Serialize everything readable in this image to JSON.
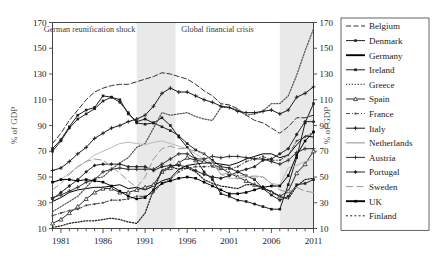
{
  "chart_data": {
    "type": "line",
    "title": "",
    "xlabel": "",
    "ylabel": "% of GDP",
    "ylabel_right": "% of GDP",
    "xlim": [
      1980,
      2011
    ],
    "ylim": [
      10,
      170
    ],
    "yticks": [
      10,
      30,
      50,
      70,
      90,
      110,
      130,
      150,
      170
    ],
    "xticks": [
      1981,
      1986,
      1991,
      1996,
      2001,
      2006,
      2011
    ],
    "x_minor_step": 1,
    "grid": false,
    "legend_position": "right-outside",
    "annotations": [
      {
        "text": "German reunification shock",
        "x": 1984.4,
        "y": 163
      },
      {
        "text": "Global financial crisis",
        "x": 1999.6,
        "y": 163
      }
    ],
    "shaded_bands": [
      {
        "label": "German reunification shock",
        "x0": 1990.0,
        "x1": 1994.6,
        "color": "#e9e9e9"
      },
      {
        "label": "Global financial crisis",
        "x0": 2007.0,
        "x1": 2011.0,
        "color": "#e9e9e9"
      }
    ],
    "x": [
      1980,
      1981,
      1982,
      1983,
      1984,
      1985,
      1986,
      1987,
      1988,
      1989,
      1990,
      1991,
      1992,
      1993,
      1994,
      1995,
      1996,
      1997,
      1998,
      1999,
      2000,
      2001,
      2002,
      2003,
      2004,
      2005,
      2006,
      2007,
      2008,
      2009,
      2010,
      2011
    ],
    "series": [
      {
        "name": "Belgium",
        "style": "dashed",
        "marker": "none",
        "color": "#333333",
        "values": [
          76,
          84,
          94,
          102,
          110,
          116,
          119,
          121,
          122,
          122,
          124,
          126,
          128,
          131,
          130,
          128,
          126,
          122,
          117,
          113,
          107,
          106,
          103,
          98,
          94,
          92,
          88,
          84,
          89,
          96,
          96,
          98
        ]
      },
      {
        "name": "Denmark",
        "style": "solid",
        "marker": "square",
        "color": "#222222",
        "values": [
          70,
          78,
          88,
          95,
          99,
          103,
          109,
          112,
          108,
          100,
          92,
          91,
          92,
          89,
          86,
          82,
          76,
          71,
          68,
          63,
          58,
          57,
          54,
          51,
          48,
          41,
          36,
          32,
          35,
          44,
          45,
          48
        ]
      },
      {
        "name": "Germany",
        "style": "solid",
        "marker": "none",
        "color": "#000000",
        "values": [
          31,
          34,
          38,
          40,
          41,
          42,
          42,
          43,
          44,
          41,
          42,
          40,
          43,
          47,
          49,
          56,
          59,
          60,
          61,
          61,
          60,
          59,
          61,
          64,
          66,
          68,
          68,
          65,
          67,
          75,
          82,
          81
        ]
      },
      {
        "name": "Ireland",
        "style": "solid",
        "marker": "square",
        "color": "#1c1c1c",
        "values": [
          72,
          79,
          89,
          98,
          102,
          104,
          113,
          112,
          110,
          99,
          93,
          95,
          92,
          96,
          90,
          81,
          73,
          64,
          54,
          48,
          37,
          35,
          32,
          31,
          29,
          27,
          25,
          25,
          44,
          65,
          92,
          107
        ]
      },
      {
        "name": "Greece",
        "style": "dotted",
        "marker": "none",
        "color": "#555555",
        "values": [
          23,
          27,
          31,
          35,
          42,
          49,
          50,
          56,
          61,
          65,
          73,
          76,
          88,
          100,
          98,
          99,
          100,
          97,
          95,
          94,
          104,
          104,
          102,
          98,
          99,
          101,
          107,
          107,
          113,
          129,
          148,
          165
        ]
      },
      {
        "name": "Spain",
        "style": "solid",
        "marker": "triangle-open",
        "color": "#2a2a2a",
        "values": [
          14,
          17,
          22,
          27,
          33,
          38,
          41,
          41,
          38,
          38,
          40,
          42,
          44,
          54,
          57,
          61,
          65,
          63,
          62,
          60,
          57,
          53,
          50,
          47,
          44,
          42,
          38,
          35,
          39,
          53,
          60,
          70
        ]
      },
      {
        "name": "France",
        "style": "dash-dot",
        "marker": "dot",
        "color": "#4a4a4a",
        "values": [
          20,
          22,
          24,
          25,
          28,
          29,
          30,
          32,
          32,
          33,
          35,
          35,
          38,
          45,
          48,
          54,
          57,
          58,
          58,
          58,
          56,
          56,
          58,
          62,
          64,
          66,
          63,
          63,
          67,
          78,
          81,
          85
        ]
      },
      {
        "name": "Italy",
        "style": "solid",
        "marker": "plus",
        "color": "#1a1a1a",
        "values": [
          55,
          57,
          62,
          68,
          73,
          80,
          84,
          88,
          90,
          93,
          95,
          98,
          105,
          115,
          119,
          116,
          116,
          113,
          110,
          108,
          105,
          104,
          101,
          100,
          100,
          101,
          102,
          99,
          102,
          112,
          115,
          120
        ]
      },
      {
        "name": "Netherlands",
        "style": "solid",
        "marker": "none",
        "color": "#b9b9b9",
        "values": [
          45,
          48,
          53,
          58,
          62,
          67,
          70,
          73,
          76,
          77,
          76,
          75,
          77,
          78,
          76,
          74,
          72,
          68,
          64,
          61,
          52,
          49,
          49,
          50,
          51,
          50,
          45,
          44,
          57,
          59,
          62,
          64
        ]
      },
      {
        "name": "Austria",
        "style": "solid",
        "marker": "plus",
        "color": "#2f2f2f",
        "values": [
          34,
          36,
          39,
          42,
          46,
          48,
          54,
          56,
          57,
          56,
          56,
          56,
          56,
          60,
          64,
          68,
          68,
          64,
          64,
          66,
          65,
          66,
          66,
          65,
          64,
          64,
          62,
          60,
          63,
          69,
          72,
          72
        ]
      },
      {
        "name": "Portugal",
        "style": "solid",
        "marker": "diamond",
        "color": "#262626",
        "values": [
          33,
          38,
          43,
          48,
          54,
          59,
          60,
          60,
          60,
          58,
          58,
          58,
          55,
          58,
          59,
          59,
          58,
          55,
          52,
          50,
          49,
          51,
          54,
          56,
          58,
          63,
          64,
          68,
          72,
          83,
          93,
          93
        ]
      },
      {
        "name": "Sweden",
        "style": "long-dash",
        "marker": "none",
        "color": "#9a9a9a",
        "values": [
          40,
          45,
          52,
          58,
          62,
          64,
          63,
          58,
          53,
          47,
          42,
          50,
          64,
          72,
          74,
          72,
          72,
          70,
          68,
          62,
          52,
          53,
          51,
          51,
          50,
          50,
          45,
          40,
          38,
          42,
          39,
          38
        ]
      },
      {
        "name": "UK",
        "style": "solid",
        "marker": "square-filled",
        "color": "#000000",
        "values": [
          46,
          48,
          48,
          47,
          48,
          47,
          46,
          43,
          39,
          35,
          33,
          34,
          40,
          45,
          47,
          49,
          50,
          49,
          46,
          43,
          40,
          37,
          37,
          38,
          40,
          42,
          43,
          43,
          51,
          67,
          78,
          85
        ]
      },
      {
        "name": "Finland",
        "style": "dotted",
        "marker": "none",
        "color": "#1f1f1f",
        "values": [
          11,
          12,
          14,
          15,
          16,
          16,
          17,
          18,
          17,
          15,
          14,
          22,
          40,
          55,
          58,
          56,
          57,
          54,
          48,
          45,
          43,
          42,
          41,
          44,
          44,
          41,
          39,
          35,
          33,
          43,
          48,
          49
        ]
      }
    ],
    "legend_entries": [
      {
        "label": "Belgium",
        "style": "dashed",
        "marker": "none"
      },
      {
        "label": "Denmark",
        "style": "solid",
        "marker": "square"
      },
      {
        "label": "Germany",
        "style": "solid-thick",
        "marker": "none"
      },
      {
        "label": "Ireland",
        "style": "solid",
        "marker": "square"
      },
      {
        "label": "Greece",
        "style": "dotted",
        "marker": "none"
      },
      {
        "label": "Spain",
        "style": "solid",
        "marker": "triangle-open"
      },
      {
        "label": "France",
        "style": "dash-dot",
        "marker": "dot"
      },
      {
        "label": "Italy",
        "style": "solid",
        "marker": "plus"
      },
      {
        "label": "Netherlands",
        "style": "solid-light",
        "marker": "none"
      },
      {
        "label": "Austria",
        "style": "solid",
        "marker": "plus"
      },
      {
        "label": "Portugal",
        "style": "solid",
        "marker": "diamond"
      },
      {
        "label": "Sweden",
        "style": "long-dash",
        "marker": "none"
      },
      {
        "label": "UK",
        "style": "solid-thick",
        "marker": "square-filled"
      },
      {
        "label": "Finland",
        "style": "dotted-coarse",
        "marker": "none"
      }
    ]
  }
}
